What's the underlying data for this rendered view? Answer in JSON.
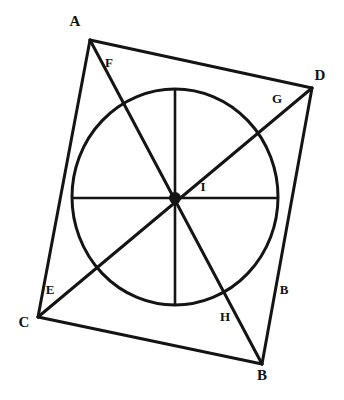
{
  "figure": {
    "type": "geometry-diagram",
    "canvas": {
      "width": 344,
      "height": 400,
      "background": "#ffffff"
    },
    "stroke_color": "#141414",
    "label_color": "#111111"
  },
  "points": {
    "A": {
      "label": "A",
      "x": 90,
      "y": 40,
      "label_x": 75,
      "label_y": 23
    },
    "D": {
      "label": "D",
      "x": 312,
      "y": 88,
      "label_x": 320,
      "label_y": 77
    },
    "B": {
      "label": "B",
      "x": 262,
      "y": 364,
      "label_x": 262,
      "label_y": 377
    },
    "C": {
      "label": "C",
      "x": 38,
      "y": 317,
      "label_x": 24,
      "label_y": 324
    },
    "F": {
      "label": "F",
      "x": 114,
      "y": 76,
      "label_x": 109,
      "label_y": 64
    },
    "G": {
      "label": "G",
      "x": 262,
      "y": 117,
      "label_x": 277,
      "label_y": 100
    },
    "E": {
      "label": "E",
      "x": 86,
      "y": 280,
      "label_x": 50,
      "label_y": 291
    },
    "H": {
      "label": "H",
      "x": 236,
      "y": 294,
      "label_x": 225,
      "label_y": 318
    },
    "I": {
      "label": "I",
      "x": 175,
      "y": 198,
      "label_x": 203,
      "label_y": 188
    },
    "B_side": {
      "label": "B",
      "label_x": 284,
      "label_y": 291
    }
  },
  "circle": {
    "name": "inscribed-circle",
    "center_x": 175,
    "center_y": 197,
    "radius_x": 103,
    "radius_y": 108
  },
  "center_dot": {
    "name": "center-point-I",
    "cx": 175,
    "cy": 198,
    "r": 6
  },
  "edges": [
    {
      "name": "edge-A-D",
      "from": "A",
      "to": "D",
      "x1": 90,
      "y1": 40,
      "x2": 312,
      "y2": 88
    },
    {
      "name": "edge-D-B",
      "from": "D",
      "to": "B",
      "x1": 312,
      "y1": 88,
      "x2": 262,
      "y2": 364
    },
    {
      "name": "edge-B-C",
      "from": "B",
      "to": "C",
      "x1": 262,
      "y1": 364,
      "x2": 38,
      "y2": 317
    },
    {
      "name": "edge-C-A",
      "from": "C",
      "to": "A",
      "x1": 38,
      "y1": 317,
      "x2": 90,
      "y2": 40
    }
  ],
  "diagonals": [
    {
      "name": "diagonal-A-B",
      "from": "A",
      "to": "B",
      "x1": 90,
      "y1": 40,
      "x2": 262,
      "y2": 364
    },
    {
      "name": "diagonal-C-D",
      "from": "C",
      "to": "D",
      "x1": 38,
      "y1": 317,
      "x2": 312,
      "y2": 88
    }
  ],
  "radii": [
    {
      "name": "radius-up",
      "x1": 175,
      "y1": 198,
      "x2": 175,
      "y2": 89
    },
    {
      "name": "radius-down",
      "x1": 175,
      "y1": 198,
      "x2": 175,
      "y2": 305
    },
    {
      "name": "radius-left",
      "x1": 175,
      "y1": 198,
      "x2": 72,
      "y2": 198
    },
    {
      "name": "radius-right",
      "x1": 175,
      "y1": 198,
      "x2": 278,
      "y2": 198
    }
  ]
}
